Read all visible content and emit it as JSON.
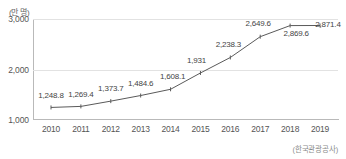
{
  "chart_data": {
    "type": "line",
    "title": "",
    "subtitle": "",
    "xlabel": "",
    "ylabel": "",
    "unit_label": "(만 명)",
    "source": "(한국관광공사)",
    "categories": [
      "2010",
      "2011",
      "2012",
      "2013",
      "2014",
      "2015",
      "2016",
      "2017",
      "2018",
      "2019"
    ],
    "values": [
      1248.8,
      1269.4,
      1373.7,
      1484.6,
      1608.1,
      1931,
      2238.3,
      2649.6,
      2869.6,
      2871.4
    ],
    "data_labels": [
      "1,248.8",
      "1,269.4",
      "1,373.7",
      "1,484.6",
      "1,608.1",
      "1,931",
      "2,238.3",
      "2,649.6",
      "2,869.6",
      "2,871.4"
    ],
    "ylim": [
      1000,
      3000
    ],
    "yticks": [
      1000,
      2000,
      3000
    ],
    "ytick_labels": [
      "1,000",
      "2,000",
      "3,000"
    ],
    "grid": true,
    "legend": "none",
    "series_color": "#5a5a5a",
    "grid_color": "#e2e2e2",
    "axis_color": "#b9b9b9",
    "label_color": "#444444"
  },
  "label_offsets": [
    {
      "dx": 0,
      "dy": -7
    },
    {
      "dx": 0,
      "dy": -7
    },
    {
      "dx": 0,
      "dy": -8
    },
    {
      "dx": 0,
      "dy": -8
    },
    {
      "dx": 2,
      "dy": -8
    },
    {
      "dx": -4,
      "dy": -8
    },
    {
      "dx": -2,
      "dy": -8
    },
    {
      "dx": -2,
      "dy": -9
    },
    {
      "dx": 6,
      "dy": 12
    },
    {
      "dx": 8,
      "dy": 4
    }
  ]
}
